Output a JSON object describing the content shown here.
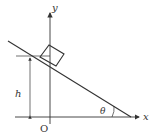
{
  "diagram": {
    "type": "physics-incline",
    "labels": {
      "x_axis": "x",
      "y_axis": "y",
      "origin": "O",
      "height": "h",
      "angle": "θ"
    },
    "colors": {
      "stroke": "#333333",
      "background": "#ffffff"
    }
  }
}
